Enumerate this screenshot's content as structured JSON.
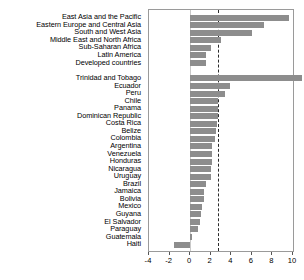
{
  "chart_data": {
    "type": "bar",
    "orientation": "horizontal",
    "title": "",
    "subtitle": "",
    "xlabel": "",
    "ylabel": "",
    "xlim": [
      -4,
      10
    ],
    "xticks": [
      -4,
      -2,
      0,
      2,
      4,
      6,
      8,
      10
    ],
    "xticklabels": [
      "-4",
      "-2",
      "0",
      "2",
      "4",
      "6",
      "8",
      "10"
    ],
    "grid": false,
    "legend": null,
    "reference_line": {
      "value": 2.7,
      "style": "dashed",
      "color": "#2b2b2b"
    },
    "bar_color": "#8d8d8d",
    "groups": [
      {
        "name": "regions",
        "categories": [
          "East Asia and the Pacific",
          "Eastern Europe and Central Asia",
          "South and West Asia",
          "Middle East and North Africa",
          "Sub-Saharan Africa",
          "Latin America",
          "Developed countries"
        ],
        "values": [
          9.6,
          7.2,
          6.0,
          3.0,
          2.0,
          1.5,
          1.5
        ]
      },
      {
        "name": "countries",
        "categories": [
          "Trinidad and Tobago",
          "Ecuador",
          "Peru",
          "Chile",
          "Panama",
          "Dominican Republic",
          "Costa Rica",
          "Belize",
          "Colombia",
          "Argentina",
          "Venezuela",
          "Honduras",
          "Nicaragua",
          "Uruguay",
          "Brazil",
          "Jamaica",
          "Bolivia",
          "Mexico",
          "Guyana",
          "El Salvador",
          "Paraguay",
          "Guatemala",
          "Haiti"
        ],
        "values": [
          10.9,
          3.9,
          3.4,
          2.7,
          2.7,
          2.7,
          2.6,
          2.5,
          2.4,
          2.1,
          2.1,
          2.1,
          2.0,
          2.0,
          1.5,
          1.3,
          1.3,
          1.2,
          1.1,
          1.0,
          0.8,
          0.2,
          -1.6
        ]
      }
    ]
  }
}
